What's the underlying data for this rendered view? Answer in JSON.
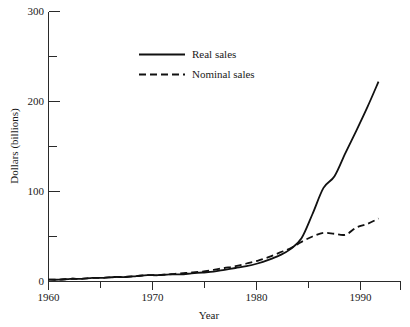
{
  "chart_data": {
    "type": "line",
    "title": "",
    "xlabel": "Year",
    "ylabel": "Dollars (billions)",
    "xlim": [
      1960,
      1992
    ],
    "ylim": [
      0,
      300
    ],
    "grid": false,
    "legend_position": "upper-center",
    "x_ticks": [
      1960,
      1965,
      1970,
      1975,
      1980,
      1985,
      1990
    ],
    "x_tick_labels": [
      "1960",
      "",
      "1970",
      "",
      "1980",
      "",
      "1990"
    ],
    "y_ticks": [
      0,
      50,
      100,
      150,
      200,
      250,
      300
    ],
    "y_tick_labels": [
      "0",
      "",
      "100",
      "",
      "200",
      "",
      "300"
    ],
    "x": [
      1960,
      1961,
      1962,
      1963,
      1964,
      1965,
      1966,
      1967,
      1968,
      1969,
      1970,
      1971,
      1972,
      1973,
      1974,
      1975,
      1976,
      1977,
      1978,
      1979,
      1980,
      1981,
      1982,
      1983,
      1984,
      1985,
      1986,
      1987,
      1988,
      1989,
      1990
    ],
    "series": [
      {
        "name": "Real sales",
        "style": "solid",
        "color": "#111111",
        "values": [
          2,
          2,
          3,
          3,
          4,
          4,
          5,
          5,
          6,
          7,
          7,
          8,
          8,
          9,
          10,
          11,
          13,
          15,
          17,
          20,
          24,
          29,
          36,
          48,
          75,
          104,
          117,
          143,
          168,
          194,
          222
        ]
      },
      {
        "name": "Nominal sales",
        "style": "dashed",
        "color": "#111111",
        "values": [
          2,
          2,
          3,
          3,
          4,
          4,
          5,
          5,
          6,
          7,
          7,
          8,
          9,
          10,
          11,
          13,
          15,
          17,
          20,
          23,
          27,
          32,
          37,
          44,
          50,
          54,
          53,
          52,
          60,
          64,
          70
        ]
      }
    ]
  },
  "legend": {
    "items": [
      {
        "label": "Real sales",
        "style": "solid"
      },
      {
        "label": "Nominal sales",
        "style": "dashed"
      }
    ]
  },
  "axes": {
    "x_title": "Year",
    "y_title": "Dollars (billions)"
  }
}
